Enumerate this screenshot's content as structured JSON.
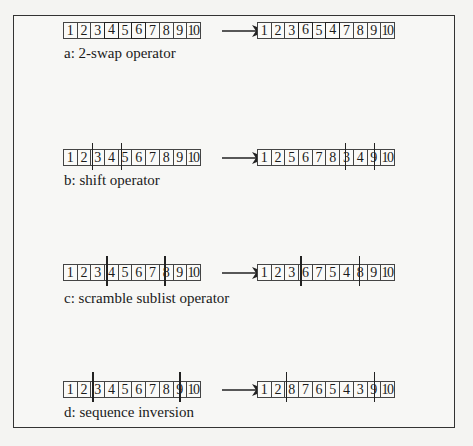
{
  "figure": {
    "panels": [
      {
        "id": "a",
        "caption": "a: 2-swap operator",
        "before": [
          "1",
          "2",
          "3",
          "4",
          "5",
          "6",
          "7",
          "8",
          "9",
          "10"
        ],
        "after": [
          "1",
          "2",
          "3",
          "6",
          "5",
          "4",
          "7",
          "8",
          "9",
          "10"
        ],
        "highlight_positions": [
          4,
          6
        ],
        "marker_positions": []
      },
      {
        "id": "b",
        "caption": "b: shift operator",
        "before": [
          "1",
          "2",
          "3",
          "4",
          "5",
          "6",
          "7",
          "8",
          "9",
          "10"
        ],
        "after": [
          "1",
          "2",
          "5",
          "6",
          "7",
          "8",
          "3",
          "4",
          "9",
          "10"
        ],
        "before_markers_after_cell": [
          2,
          4
        ],
        "after_markers_after_cell": [
          6,
          8
        ]
      },
      {
        "id": "c",
        "caption": "c: scramble sublist operator",
        "before": [
          "1",
          "2",
          "3",
          "4",
          "5",
          "6",
          "7",
          "8",
          "9",
          "10"
        ],
        "after": [
          "1",
          "2",
          "3",
          "6",
          "7",
          "5",
          "4",
          "8",
          "9",
          "10"
        ],
        "before_markers_after_cell": [
          3,
          7
        ],
        "after_markers_after_cell": [
          3,
          7
        ]
      },
      {
        "id": "d",
        "caption": "d: sequence inversion",
        "before": [
          "1",
          "2",
          "3",
          "4",
          "5",
          "6",
          "7",
          "8",
          "9",
          "10"
        ],
        "after": [
          "1",
          "2",
          "8",
          "7",
          "6",
          "5",
          "4",
          "3",
          "9",
          "10"
        ],
        "before_markers_after_cell": [
          2,
          8
        ],
        "after_markers_after_cell": [
          2,
          8
        ]
      }
    ],
    "colors": {
      "line": "#222222",
      "background": "#f4f4f2"
    }
  }
}
